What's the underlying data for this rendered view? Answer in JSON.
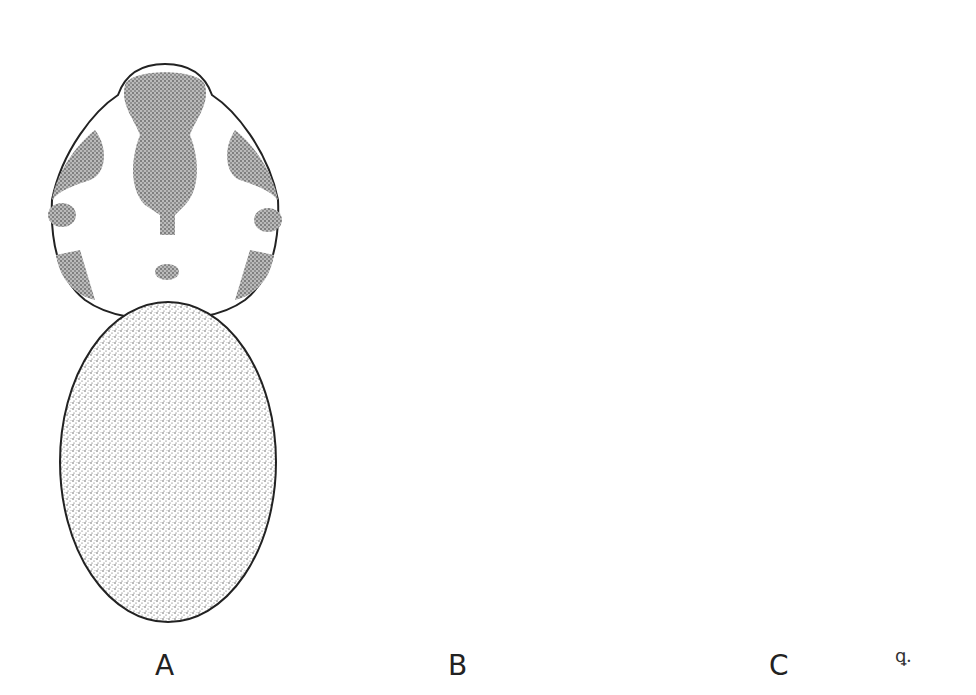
{
  "figure": {
    "panels": [
      {
        "label": "A",
        "view": "dorsal habitus, carapace with dark median and marginal patches, stippled abdomen"
      },
      {
        "label": "B",
        "view": "dorsal habitus, carapace with dark median band, pale lightly stippled abdomen"
      },
      {
        "label": "C",
        "view": "ventral habitus, sternum, coxae, epigastric furrow and spinnerets"
      }
    ],
    "signature": "ꝗ."
  },
  "colors": {
    "ink": "#222222",
    "paper": "#ffffff",
    "stipple": "#8a8a8a",
    "pale": "#e8e8e8"
  }
}
